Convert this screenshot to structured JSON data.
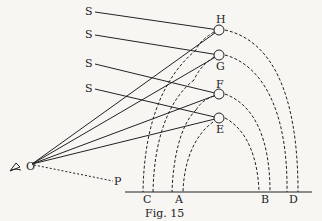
{
  "figure": {
    "caption": "Fig. 15",
    "observer_label": "O",
    "point_p_label": "P",
    "sun_ray_labels": [
      "S",
      "S",
      "S",
      "S"
    ],
    "drop_labels": [
      "H",
      "G",
      "F",
      "E"
    ],
    "ground_labels": [
      "C",
      "A",
      "B",
      "D"
    ]
  }
}
